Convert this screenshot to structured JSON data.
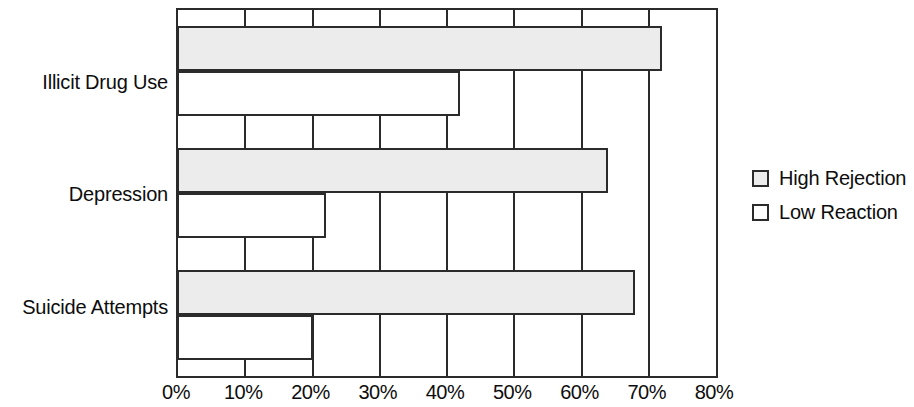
{
  "chart_data": {
    "type": "bar",
    "orientation": "horizontal",
    "title": "",
    "xlabel": "",
    "ylabel": "",
    "xlim": [
      0,
      80
    ],
    "xtick_labels": [
      "0%",
      "10%",
      "20%",
      "30%",
      "40%",
      "50%",
      "60%",
      "70%",
      "80%"
    ],
    "xtick_values": [
      0,
      10,
      20,
      30,
      40,
      50,
      60,
      70,
      80
    ],
    "grid": true,
    "categories": [
      "Illicit Drug Use",
      "Depression",
      "Suicide Attempts"
    ],
    "series": [
      {
        "name": "High Rejection",
        "color": "#ececec",
        "values": [
          72,
          64,
          68
        ]
      },
      {
        "name": "Low Reaction",
        "color": "#ffffff",
        "values": [
          42,
          22,
          20
        ]
      }
    ],
    "legend": {
      "position": "right",
      "entries": [
        {
          "label": "High Rejection",
          "swatch": "#ececec"
        },
        {
          "label": "Low Reaction",
          "swatch": "#ffffff"
        }
      ]
    }
  }
}
